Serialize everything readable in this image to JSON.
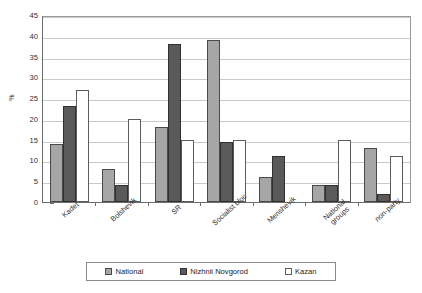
{
  "chart_data": {
    "type": "bar",
    "title": "",
    "xlabel": "",
    "ylabel": "%",
    "ylim": [
      0,
      45
    ],
    "ystep": 5,
    "grid": true,
    "legend_position": "bottom",
    "categories": [
      "Kadet",
      "Bolshevik",
      "SR",
      "Socialist bloc",
      "Menshevik",
      "National\ngroups",
      "non-party"
    ],
    "series": [
      {
        "name": "National",
        "color": "#a6a6a6",
        "values": [
          14,
          8,
          18,
          39,
          6,
          4,
          13
        ]
      },
      {
        "name": "Nizhnii Novgorod",
        "color": "#5a5a5a",
        "values": [
          23,
          4,
          38,
          14.5,
          11,
          4,
          2
        ]
      },
      {
        "name": "Kazan",
        "color": "#ffffff",
        "values": [
          27,
          20,
          15,
          15,
          0,
          15,
          11
        ]
      }
    ]
  },
  "axis": {
    "y_ticks": [
      "45",
      "40",
      "35",
      "30",
      "25",
      "20",
      "15",
      "10",
      "5",
      "0"
    ],
    "y_title": "%"
  },
  "legend": {
    "items": [
      {
        "label": "National",
        "swatch": "national"
      },
      {
        "label": "Nizhnii Novgorod",
        "swatch": "nn"
      },
      {
        "label": "Kazan",
        "swatch": "kazan"
      }
    ]
  }
}
